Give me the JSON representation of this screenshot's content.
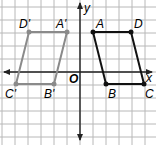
{
  "figure": {
    "grid": {
      "cell_px": 13,
      "color": "#b8b8b8",
      "background": "#ffffff"
    },
    "axes": {
      "x_label": "x",
      "y_label": "y",
      "origin_label": "O",
      "color": "#222222"
    },
    "colors": {
      "original": "#111111",
      "image": "#8a8a8a"
    },
    "original": {
      "name": "ABCD",
      "points": [
        {
          "label": "A",
          "x": 1,
          "y": 3
        },
        {
          "label": "D",
          "x": 4,
          "y": 3
        },
        {
          "label": "C",
          "x": 5,
          "y": -1
        },
        {
          "label": "B",
          "x": 2,
          "y": -1
        }
      ]
    },
    "image": {
      "name": "A'B'C'D'",
      "points": [
        {
          "label": "A'",
          "x": -1,
          "y": 3
        },
        {
          "label": "D'",
          "x": -4,
          "y": 3
        },
        {
          "label": "C'",
          "x": -5,
          "y": -1
        },
        {
          "label": "B'",
          "x": -2,
          "y": -1
        }
      ]
    }
  }
}
